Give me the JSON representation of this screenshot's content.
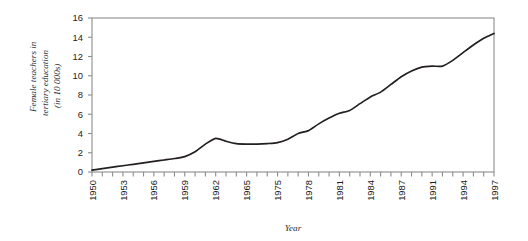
{
  "chart_data": {
    "type": "line",
    "title": "",
    "xlabel": "Year",
    "ylabel": "Female teachers in tertiary education (in 10 000s)",
    "ylabel_lines": [
      "Female teachers in",
      "tertiary education",
      "(in 10 000s)"
    ],
    "ylim": [
      0,
      16
    ],
    "yticks": [
      0,
      2,
      4,
      6,
      8,
      10,
      12,
      14,
      16
    ],
    "ytick_labels": [
      "0",
      "2",
      "4",
      "6",
      "8",
      "10",
      "12",
      "14",
      "16"
    ],
    "xtick_labels": [
      "1950",
      "1953",
      "1956",
      "1959",
      "1962",
      "1965",
      "1975",
      "1978",
      "1981",
      "1984",
      "1987",
      "1991",
      "1994",
      "1997"
    ],
    "xtick_label_positions": [
      0,
      3,
      6,
      9,
      12,
      15,
      18,
      21,
      24,
      27,
      30,
      33,
      36,
      39
    ],
    "n_ticks": 40,
    "grid": false,
    "legend": null,
    "line_color": "#231f20",
    "frame_color": "#8d8d8d",
    "series": [
      {
        "name": "Female teachers in tertiary education",
        "x": [
          0,
          1,
          2,
          3,
          4,
          5,
          6,
          7,
          8,
          9,
          10,
          11,
          12,
          13,
          14,
          15,
          16,
          17,
          18,
          19,
          20,
          21,
          22,
          23,
          24,
          25,
          26,
          27,
          28,
          29,
          30,
          31,
          32,
          33,
          34,
          35,
          36,
          37,
          38,
          39
        ],
        "x_labels": [
          "1950",
          "1951",
          "1952",
          "1953",
          "1954",
          "1955",
          "1956",
          "1957",
          "1958",
          "1959",
          "1960",
          "1961",
          "1962",
          "1963",
          "1964",
          "1965",
          "1975",
          "1976",
          "1977",
          "1978",
          "1979",
          "1980",
          "1981",
          "1982",
          "1983",
          "1984",
          "1985",
          "1986",
          "1987",
          "1988",
          "1989",
          "1990",
          "1991",
          "1992",
          "1993",
          "1994",
          "1995",
          "1996",
          "1997",
          "1998"
        ],
        "values": [
          0.2,
          0.35,
          0.5,
          0.65,
          0.8,
          0.95,
          1.1,
          1.25,
          1.4,
          1.6,
          2.1,
          2.9,
          3.5,
          3.2,
          2.95,
          2.9,
          2.9,
          2.95,
          3.05,
          3.4,
          4.0,
          4.3,
          5.0,
          5.6,
          6.1,
          6.4,
          7.1,
          7.8,
          8.3,
          9.1,
          9.9,
          10.5,
          10.9,
          11.0,
          11.0,
          11.6,
          12.4,
          13.2,
          13.9,
          14.4
        ]
      }
    ]
  },
  "figure": {
    "background": "#ffffff",
    "plot_area": {
      "left": 92,
      "top": 18,
      "right": 494,
      "bottom": 172
    }
  }
}
